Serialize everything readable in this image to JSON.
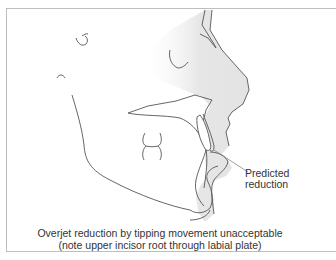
{
  "figure": {
    "annotation": {
      "line1": "Predicted",
      "line2": "reduction"
    },
    "caption": {
      "line1": "Overjet reduction by tipping movement unacceptable",
      "line2": "(note upper incisor root through labial plate)"
    },
    "colors": {
      "line": "#555555",
      "soft_tissue_fill": "#e9e9e9",
      "frame": "#bdbdbd",
      "text": "#333333"
    }
  }
}
